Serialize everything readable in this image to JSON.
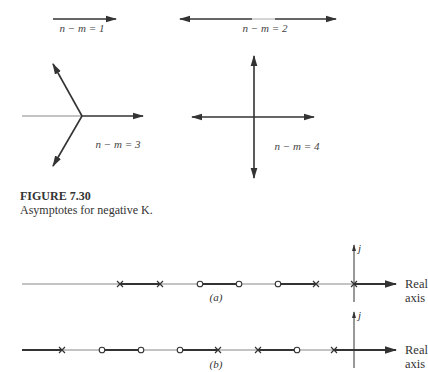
{
  "figure": {
    "number": "FIGURE 7.30",
    "caption": "Asymptotes for negative K."
  },
  "asymptote_panels": [
    {
      "label": "n − m = 1",
      "n_minus_m": 1,
      "angles_deg": [
        0
      ]
    },
    {
      "label": "n − m = 2",
      "n_minus_m": 2,
      "angles_deg": [
        0,
        180
      ]
    },
    {
      "label": "n − m = 3",
      "n_minus_m": 3,
      "angles_deg": [
        0,
        120,
        240
      ]
    },
    {
      "label": "n − m = 4",
      "n_minus_m": 4,
      "angles_deg": [
        0,
        90,
        180,
        270
      ]
    }
  ],
  "real_axis_examples": [
    {
      "sublabel": "(a)",
      "poles_x": [
        120,
        160,
        316,
        354
      ],
      "zeros_x": [
        200,
        239,
        278
      ],
      "axis_label_line1": "Real",
      "axis_label_line2": "axis",
      "imag_label": "j"
    },
    {
      "sublabel": "(b)",
      "poles_x": [
        62,
        218,
        258,
        334
      ],
      "zeros_x": [
        102,
        141,
        180,
        297
      ],
      "axis_label_line1": "Real",
      "axis_label_line2": "axis",
      "imag_label": "j"
    }
  ],
  "colors": {
    "ink": "#333333",
    "thin_line": "#888888"
  }
}
